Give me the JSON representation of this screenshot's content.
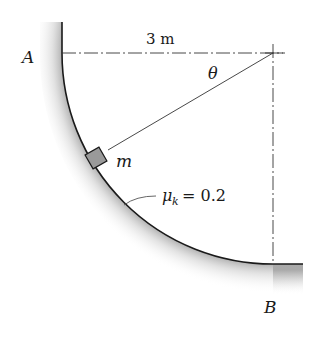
{
  "diagram": {
    "labels": {
      "point_a": "A",
      "point_b": "B",
      "distance": "3 m",
      "angle": "θ",
      "mass": "m",
      "friction_symbol": "μ",
      "friction_subscript": "k",
      "friction_value": "= 0.2"
    },
    "colors": {
      "line": "#1a1a1a",
      "construction_line": "#333333",
      "block_fill": "#9a9a9a",
      "surface_shade": "#bdbdbd"
    }
  }
}
